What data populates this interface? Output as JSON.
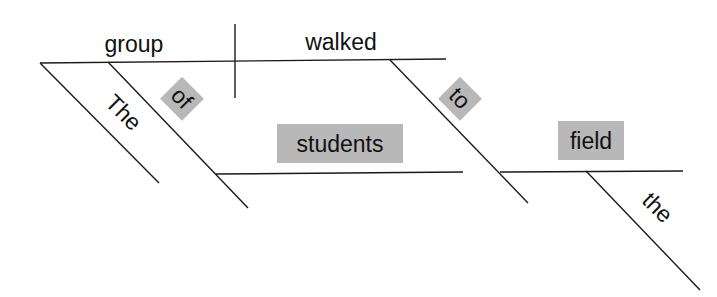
{
  "diagram": {
    "type": "sentence-diagram",
    "sentence": "The group of students walked to the field",
    "highlight_color": "#b8b8b8",
    "line_color": "#1a1a1a",
    "words": {
      "subject": "group",
      "verb": "walked",
      "subject_modifier": "The",
      "preposition_1": "of",
      "object_1": "students",
      "preposition_2": "to",
      "object_2": "field",
      "object_2_modifier": "the"
    },
    "highlighted_words": [
      "of",
      "students",
      "to",
      "field"
    ]
  }
}
